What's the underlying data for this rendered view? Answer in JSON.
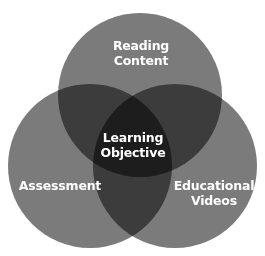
{
  "diagram": {
    "type": "venn",
    "sets": [
      {
        "name": "Reading Content",
        "line1": "Reading",
        "line2": "Content"
      },
      {
        "name": "Assessment",
        "line1": "Assessment"
      },
      {
        "name": "Educational Videos",
        "line1": "Educational",
        "line2": "Videos"
      }
    ],
    "center": {
      "line1": "Learning",
      "line2": "Objective"
    },
    "colors": {
      "circle": "#7b7b7b",
      "label": "#ffffff",
      "background": "#ffffff"
    }
  }
}
